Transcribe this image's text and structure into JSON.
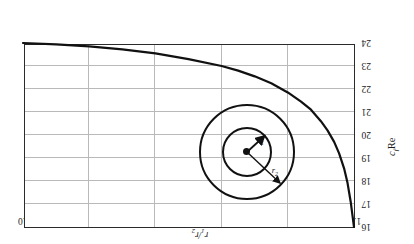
{
  "chart_data": {
    "type": "line",
    "title": "",
    "xlabel": "r1/r2",
    "ylabel": "cf Re",
    "xlim": [
      0.0,
      1.0
    ],
    "ylim": [
      24,
      16
    ],
    "grid": true,
    "legend": null,
    "xticks": [
      "0.0",
      "0.2",
      "0.4",
      "0.6",
      "0.8",
      "1.0"
    ],
    "xtick_values": [
      0.0,
      0.2,
      0.4,
      0.6,
      0.8,
      1.0
    ],
    "yticks": [
      "16",
      "17",
      "18",
      "19",
      "20",
      "21",
      "22",
      "23",
      "24"
    ],
    "ytick_values": [
      16,
      17,
      18,
      19,
      20,
      21,
      22,
      23,
      24
    ],
    "series": [
      {
        "name": "cf Re vs r1/r2",
        "x": [
          0.0,
          0.005,
          0.01,
          0.02,
          0.03,
          0.045,
          0.06,
          0.08,
          0.1,
          0.13,
          0.16,
          0.2,
          0.25,
          0.3,
          0.35,
          0.4,
          0.5,
          0.6,
          0.7,
          0.8,
          0.9,
          1.0
        ],
        "y": [
          16.0,
          16.55,
          17.1,
          17.95,
          18.55,
          19.2,
          19.7,
          20.2,
          20.6,
          21.1,
          21.45,
          21.85,
          22.25,
          22.55,
          22.8,
          23.0,
          23.3,
          23.55,
          23.72,
          23.85,
          23.94,
          24.0
        ]
      }
    ]
  },
  "axes": {
    "x_label_text": "r",
    "x_label_sub1": "1",
    "x_label_slash": "/r",
    "x_label_sub2": "2",
    "y_label_c": "c",
    "y_label_f": "f",
    "y_label_re": "Re"
  },
  "inset": {
    "name": "concentric-annulus-diagram",
    "inner_radius_label": "r",
    "inner_radius_sub": "1",
    "outer_radius_label": "r",
    "outer_radius_sub": "2"
  },
  "colors": {
    "curve": "#111111",
    "grid": "#b9b9b9",
    "frame": "#2b2b2b",
    "text": "#1a1a1a"
  }
}
